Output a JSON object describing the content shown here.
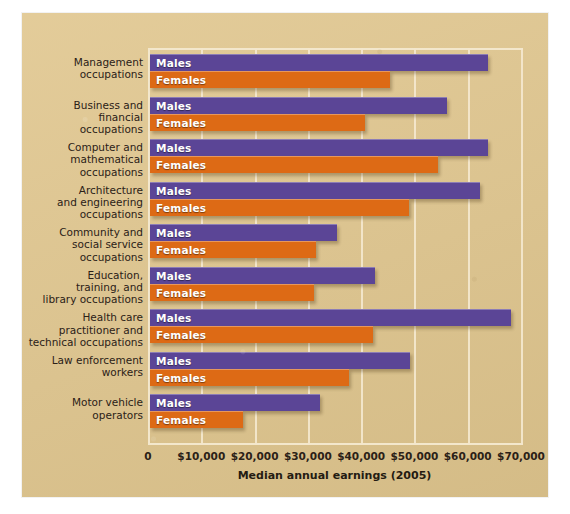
{
  "chart_data": {
    "type": "bar",
    "orientation": "horizontal",
    "title": "",
    "xlabel": "Median annual earnings (2005)",
    "ylabel": "",
    "xlim": [
      0,
      70000
    ],
    "xticks": [
      0,
      10000,
      20000,
      30000,
      40000,
      50000,
      60000,
      70000
    ],
    "xticklabels": [
      "0",
      "$10,000",
      "$20,000",
      "$30,000",
      "$40,000",
      "$50,000",
      "$60,000",
      "$70,000"
    ],
    "grid": true,
    "legend": "inline-bar-labels",
    "categories": [
      "Management\noccupations",
      "Business and\nfinancial\noccupations",
      "Computer and\nmathematical\noccupations",
      "Architecture\nand engineering\noccupations",
      "Community and\nsocial service\noccupations",
      "Education,\ntraining, and\nlibrary occupations",
      "Health care\npractitioner and\ntechnical occupations",
      "Law enforcement\nworkers",
      "Motor vehicle\noperators"
    ],
    "series": [
      {
        "name": "Males",
        "color": "#5b4596",
        "values": [
          63400,
          55700,
          63400,
          61900,
          35000,
          42200,
          67700,
          48800,
          31900
        ]
      },
      {
        "name": "Females",
        "color": "#dd6a15",
        "values": [
          45000,
          40300,
          54000,
          48600,
          31200,
          30800,
          41800,
          37400,
          17400
        ]
      }
    ]
  },
  "figure": {
    "background_color": "#e0c68e",
    "gridline_color": "#f3e7cc"
  }
}
